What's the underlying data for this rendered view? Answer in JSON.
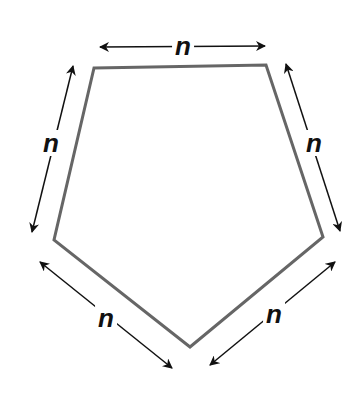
{
  "diagram": {
    "shape": "regular pentagon",
    "stroke_color": "#666666",
    "arrow_color": "#111111",
    "vertices": [
      [
        94,
        68
      ],
      [
        266,
        65
      ],
      [
        323,
        237
      ],
      [
        190,
        347
      ],
      [
        54,
        240
      ]
    ],
    "side_labels": [
      {
        "side": "top",
        "text": "n"
      },
      {
        "side": "upper-right",
        "text": "n"
      },
      {
        "side": "lower-right",
        "text": "n"
      },
      {
        "side": "lower-left",
        "text": "n"
      },
      {
        "side": "upper-left",
        "text": "n"
      }
    ]
  }
}
